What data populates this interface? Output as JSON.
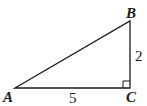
{
  "diagram": {
    "type": "right-triangle",
    "vertices": {
      "A": {
        "label": "A"
      },
      "B": {
        "label": "B"
      },
      "C": {
        "label": "C"
      }
    },
    "sides": {
      "AC": {
        "length_label": "5"
      },
      "BC": {
        "length_label": "2"
      }
    },
    "right_angle_at": "C",
    "stroke_color": "#1a1a1a"
  }
}
